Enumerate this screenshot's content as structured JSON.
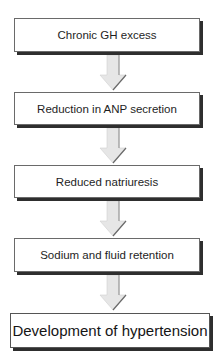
{
  "diagram": {
    "type": "flowchart",
    "direction": "top-to-bottom",
    "nodes": [
      {
        "id": "n1",
        "label": "Chronic GH excess"
      },
      {
        "id": "n2",
        "label": "Reduction in ANP secretion"
      },
      {
        "id": "n3",
        "label": "Reduced natriuresis"
      },
      {
        "id": "n4",
        "label": "Sodium and fluid retention"
      },
      {
        "id": "n5",
        "label": "Development of hypertension"
      }
    ],
    "edges": [
      {
        "from": "n1",
        "to": "n2"
      },
      {
        "from": "n2",
        "to": "n3"
      },
      {
        "from": "n3",
        "to": "n4"
      },
      {
        "from": "n4",
        "to": "n5"
      }
    ],
    "colors": {
      "box_fill": "#ffffff",
      "box_border": "#6a6a6a",
      "box_shadow": "#2e2e2e",
      "arrow_fill": "#e6e6e6",
      "arrow_edge": "#8a8a8a"
    }
  }
}
